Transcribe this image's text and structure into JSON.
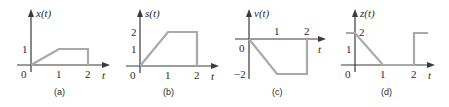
{
  "figure": {
    "panels": [
      {
        "id": "a",
        "caption": "(a)",
        "ylabel": "x(t)",
        "xlabel": "t",
        "origin_label": "0",
        "x_ticks": [
          "1",
          "2"
        ],
        "y_ticks": [
          "1"
        ],
        "points": [
          [
            0,
            0
          ],
          [
            1,
            1
          ],
          [
            2,
            1
          ],
          [
            2,
            0
          ]
        ]
      },
      {
        "id": "b",
        "caption": "(b)",
        "ylabel": "s(t)",
        "xlabel": "t",
        "origin_label": "0",
        "x_ticks": [
          "1",
          "2"
        ],
        "y_ticks": [
          "1",
          "2"
        ],
        "points": [
          [
            0,
            0
          ],
          [
            1,
            2
          ],
          [
            2,
            2
          ],
          [
            2,
            0
          ]
        ]
      },
      {
        "id": "c",
        "caption": "(c)",
        "ylabel": "v(t)",
        "xlabel": "t",
        "origin_label": "0",
        "x_ticks": [
          "1",
          "2"
        ],
        "y_ticks": [
          "−2"
        ],
        "points": [
          [
            0,
            0
          ],
          [
            1,
            -2
          ],
          [
            2,
            -2
          ],
          [
            2,
            0
          ]
        ]
      },
      {
        "id": "d",
        "caption": "(d)",
        "ylabel": "z(t)",
        "xlabel": "t",
        "origin_label": "0",
        "x_ticks": [
          "1",
          "2"
        ],
        "y_ticks": [
          "1",
          "2"
        ],
        "segments": [
          [
            [
              -0.3,
              2
            ],
            [
              0,
              2
            ],
            [
              1,
              0
            ],
            [
              2,
              0
            ],
            [
              2,
              2
            ],
            [
              2.5,
              2
            ]
          ]
        ]
      }
    ],
    "colors": {
      "axis": "#3a3a3a",
      "signal": "#a9a9a9"
    }
  }
}
